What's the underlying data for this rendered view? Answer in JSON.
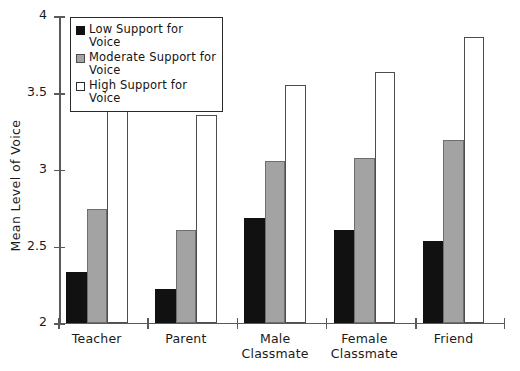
{
  "chart_data": {
    "type": "bar",
    "title": "",
    "xlabel": "",
    "ylabel": "Mean Level of Voice",
    "ylim": [
      2,
      4
    ],
    "yticks": [
      2,
      2.5,
      3,
      3.5,
      4
    ],
    "ytick_labels": [
      "2",
      "2.5",
      "3",
      "3.5",
      "4"
    ],
    "grid": false,
    "legend_position": "upper-left-inside",
    "categories": [
      "Teacher",
      "Parent",
      "Male Classmate",
      "Female Classmate",
      "Friend"
    ],
    "category_lines": [
      [
        "Teacher"
      ],
      [
        "Parent"
      ],
      [
        "Male",
        "Classmate"
      ],
      [
        "Female",
        "Classmate"
      ],
      [
        "Friend"
      ]
    ],
    "series": [
      {
        "name": "Low Support for Voice",
        "key": "low",
        "color": "#111111",
        "values": [
          2.33,
          2.22,
          2.68,
          2.6,
          2.53
        ]
      },
      {
        "name": "Moderate Support for Voice",
        "key": "moderate",
        "color": "#a3a3a3",
        "values": [
          2.74,
          2.6,
          3.05,
          3.07,
          3.19
        ]
      },
      {
        "name": "High Support for Voice",
        "key": "high",
        "color": "#ffffff",
        "values": [
          3.38,
          3.35,
          3.55,
          3.63,
          3.86
        ]
      }
    ]
  },
  "legend": {
    "items": [
      {
        "label": "Low Support for Voice",
        "key": "low"
      },
      {
        "label": "Moderate Support for Voice",
        "key": "moderate"
      },
      {
        "label": "High Support for Voice",
        "key": "high"
      }
    ]
  },
  "colors": {
    "low": "#111111",
    "moderate": "#a3a3a3",
    "high": "#ffffff",
    "axis": "#5a5a5a",
    "text": "#1a1a1a"
  }
}
